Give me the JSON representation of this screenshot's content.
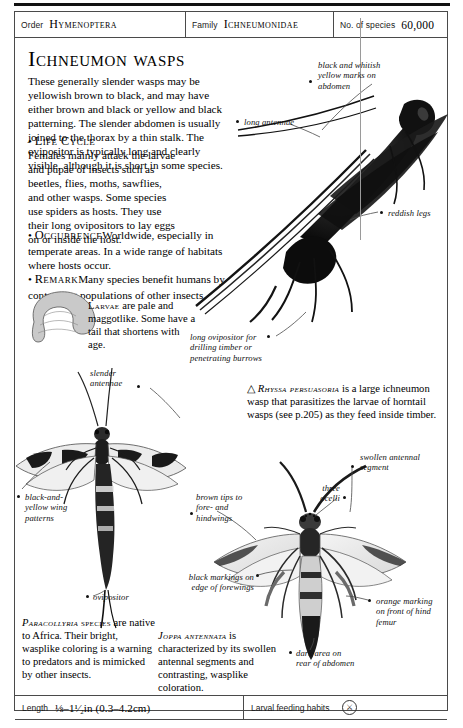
{
  "header": {
    "order_label": "Order",
    "order_value": "Hymenoptera",
    "family_label": "Family",
    "family_value": "Ichneumonidae",
    "species_label": "No. of species",
    "species_value": "60,000"
  },
  "title": "Ichneumon wasps",
  "intro": {
    "paragraph": "These generally slender wasps may be yellowish brown to black, and may have either brown and black or yellow and black patterning. The slender abdomen is usually joined to the thorax by a thin stalk. The ovipositor is typically long and clearly visible, although it is short in some species.",
    "sections": [
      {
        "bullet": "•",
        "heading": "Life Cycle",
        "text": "Females mainly attack the larvae and pupae of insects such as beetles, flies, moths, sawflies, and other wasps. Some species use spiders as hosts. They use their long ovipositors to lay eggs on or inside the host."
      },
      {
        "bullet": "•",
        "heading": "Occurrence",
        "text": "Worldwide, especially in temperate areas. In a wide range of habitats where hosts occur."
      },
      {
        "bullet": "•",
        "heading": "Remark",
        "text": "Many species benefit humans by controlling populations of other insects."
      }
    ]
  },
  "captions": {
    "larvae": {
      "heading": "Larvae",
      "text": " are pale and maggotlike. Some have a tail that shortens with age."
    },
    "rhyssa": {
      "marker": "△",
      "species": "Rhyssa persuasoria",
      "text": " is a large ichneumon wasp that parasitizes the larvae of horntail wasps (see p.205) as they feed inside timber."
    },
    "paracollyria": {
      "species": "Paracollyria",
      "species_suffix": "species",
      "text": "are native to Africa. Their bright, wasplike coloring is a warning to predators and is mimicked by other insects."
    },
    "joppa": {
      "species": "Joppa antennata",
      "text": "is characterized by its swollen antennal segments and contrasting, wasplike coloration."
    }
  },
  "annotations": [
    {
      "id": "black-and-whitish-yellow-marks",
      "text": "black and whitish\nyellow marks on\nabdomen"
    },
    {
      "id": "long-antennae",
      "text": "long antennae"
    },
    {
      "id": "reddish-legs",
      "text": "reddish legs"
    },
    {
      "id": "long-ovipositor",
      "text": "long ovipositor for\ndrilling timber or\npenetrating burrows"
    },
    {
      "id": "slender-antennae",
      "text": "slender\nantennae"
    },
    {
      "id": "black-and-yellow-wing-patterns",
      "text": "black-and-\nyellow wing\npatterns"
    },
    {
      "id": "ovipositor",
      "text": "ovipositor"
    },
    {
      "id": "swollen-antennal-segment",
      "text": "swollen antennal\nsegment"
    },
    {
      "id": "three-ocelli",
      "text": "three\nocelli"
    },
    {
      "id": "brown-tips-to-fore-and-hindwings",
      "text": "brown tips to\nfore- and\nhindwings"
    },
    {
      "id": "black-markings-on-edge-of-forewings",
      "text": "black markings on\nedge of forewings"
    },
    {
      "id": "orange-marking-on-front-of-hind-femur",
      "text": "orange marking\non front of hind\nfemur"
    },
    {
      "id": "dark-area-on-rear-of-abdomen",
      "text": "dark area on\nrear of abdomen"
    }
  ],
  "footer": {
    "length_label": "Length",
    "length_value": "⅛–1¹⁄₂in (0.3–4.2cm)",
    "habits_label": "Larval feeding habits",
    "habits_glyph": "⚔"
  }
}
